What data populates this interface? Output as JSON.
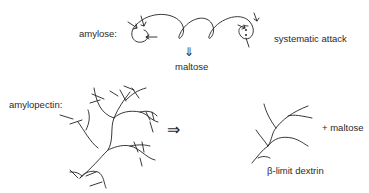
{
  "diagram": {
    "amylose": {
      "label": "amylose:",
      "annotation": "systematic attack",
      "arrow": "⇓",
      "product": "maltose"
    },
    "amylopectin": {
      "label": "amylopectin:",
      "arrow": "⇒",
      "product_label": "β-limit dextrin",
      "side_product": "+ maltose"
    },
    "colors": {
      "stroke": "#222222",
      "background": "#ffffff"
    }
  }
}
